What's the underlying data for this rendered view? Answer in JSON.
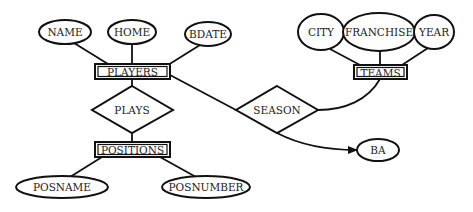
{
  "diagram": {
    "type": "entity-relationship",
    "entities": [
      {
        "id": "players",
        "label": "PLAYERS"
      },
      {
        "id": "positions",
        "label": "POSITIONS"
      },
      {
        "id": "teams",
        "label": "TEAMS"
      }
    ],
    "relationships": [
      {
        "id": "plays",
        "label": "PLAYS",
        "connects": [
          "players",
          "positions"
        ]
      },
      {
        "id": "season",
        "label": "SEASON",
        "connects": [
          "players",
          "teams"
        ]
      }
    ],
    "attributes": [
      {
        "id": "name",
        "label": "NAME",
        "of": "players"
      },
      {
        "id": "home",
        "label": "HOME",
        "of": "players"
      },
      {
        "id": "bdate",
        "label": "BDATE",
        "of": "players"
      },
      {
        "id": "city",
        "label": "CITY",
        "of": "teams"
      },
      {
        "id": "franchise",
        "label": "FRANCHISE",
        "of": "teams"
      },
      {
        "id": "year",
        "label": "YEAR",
        "of": "teams"
      },
      {
        "id": "posname",
        "label": "POSNAME",
        "of": "positions"
      },
      {
        "id": "posnumber",
        "label": "POSNUMBER",
        "of": "positions"
      },
      {
        "id": "ba",
        "label": "BA",
        "of": "season"
      }
    ]
  }
}
